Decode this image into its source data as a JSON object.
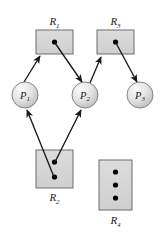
{
  "figure": {
    "colors": {
      "background": "#ffffff",
      "resource_fill": "#d6d6d6",
      "resource_stroke": "#6d6d6d",
      "process_fill_light": "#f2f2f2",
      "process_fill_dark": "#c2c2c2",
      "process_stroke": "#7a7a7a",
      "edge": "#1a1a1a",
      "dot": "#000000",
      "label": "#1a1a1a"
    }
  },
  "resources": [
    {
      "id": "R1",
      "name": "R",
      "subscript": "1",
      "instances": 1,
      "label_position": "above",
      "box": {
        "x": 36,
        "y": 30,
        "w": 37,
        "h": 24
      },
      "label": {
        "x": 54.5,
        "y": 25
      },
      "dots": [
        {
          "x": 54.5,
          "y": 42
        }
      ]
    },
    {
      "id": "R3",
      "name": "R",
      "subscript": "3",
      "instances": 1,
      "label_position": "above",
      "box": {
        "x": 97,
        "y": 30,
        "w": 37,
        "h": 24
      },
      "label": {
        "x": 115.5,
        "y": 25
      },
      "dots": [
        {
          "x": 115.5,
          "y": 42
        }
      ]
    },
    {
      "id": "R2",
      "name": "R",
      "subscript": "2",
      "instances": 2,
      "label_position": "below",
      "box": {
        "x": 36,
        "y": 150,
        "w": 37,
        "h": 38
      },
      "label": {
        "x": 54.5,
        "y": 201
      },
      "dots": [
        {
          "x": 54.5,
          "y": 162
        },
        {
          "x": 54.5,
          "y": 177
        }
      ]
    },
    {
      "id": "R4",
      "name": "R",
      "subscript": "4",
      "instances": 3,
      "label_position": "below",
      "box": {
        "x": 99,
        "y": 160,
        "w": 33,
        "h": 50
      },
      "label": {
        "x": 115.5,
        "y": 224
      },
      "dots": [
        {
          "x": 115.5,
          "y": 172
        },
        {
          "x": 115.5,
          "y": 185
        },
        {
          "x": 115.5,
          "y": 198
        }
      ]
    }
  ],
  "processes": [
    {
      "id": "P1",
      "name": "P",
      "subscript": "1",
      "circle": {
        "cx": 25,
        "cy": 95,
        "r": 13
      },
      "label": {
        "x": 25,
        "y": 98
      }
    },
    {
      "id": "P2",
      "name": "P",
      "subscript": "2",
      "circle": {
        "cx": 85,
        "cy": 95,
        "r": 13
      },
      "label": {
        "x": 85,
        "y": 98
      }
    },
    {
      "id": "P3",
      "name": "P",
      "subscript": "3",
      "circle": {
        "cx": 140,
        "cy": 95,
        "r": 13
      },
      "label": {
        "x": 140,
        "y": 98
      }
    }
  ],
  "edges": [
    {
      "id": "edge-P1-R1",
      "type": "request",
      "from": "P1",
      "to": "R1",
      "from_point": {
        "x": 24,
        "y": 82
      },
      "to_point": {
        "x": 40,
        "y": 56
      }
    },
    {
      "id": "edge-R1-P2",
      "type": "assignment",
      "from": "R1",
      "to": "P2",
      "from_point": {
        "x": 55,
        "y": 43
      },
      "to_point": {
        "x": 82,
        "y": 82
      }
    },
    {
      "id": "edge-P2-R3",
      "type": "request",
      "from": "P2",
      "to": "R3",
      "from_point": {
        "x": 90,
        "y": 83
      },
      "to_point": {
        "x": 101,
        "y": 57
      }
    },
    {
      "id": "edge-R3-P3",
      "type": "assignment",
      "from": "R3",
      "to": "P3",
      "from_point": {
        "x": 116,
        "y": 43
      },
      "to_point": {
        "x": 137,
        "y": 82
      }
    },
    {
      "id": "edge-R2-P1",
      "type": "assignment",
      "from": "R2",
      "to": "P1",
      "from_point": {
        "x": 54,
        "y": 177
      },
      "to_point": {
        "x": 27,
        "y": 109
      }
    },
    {
      "id": "edge-R2-P2",
      "type": "assignment",
      "from": "R2",
      "to": "P2",
      "from_point": {
        "x": 55,
        "y": 162
      },
      "to_point": {
        "x": 81,
        "y": 109
      }
    }
  ]
}
